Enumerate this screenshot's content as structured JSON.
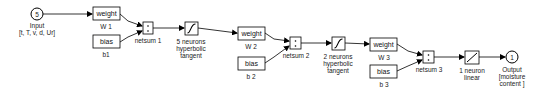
{
  "diagram": {
    "type": "neural-network-simulink",
    "input": {
      "symbol": "5",
      "label": "Input",
      "sublabel": "[t, T, v, d, Ur]"
    },
    "layers": [
      {
        "weight": {
          "box": "weight",
          "label": "W 1"
        },
        "bias": {
          "box": "bias",
          "label": "b1"
        },
        "netsum": {
          "label": "netsum 1"
        },
        "transfer": {
          "line1": "5 neurons",
          "line2": "hyperbolic",
          "line3": "tangent",
          "icon": "tansig-icon"
        }
      },
      {
        "weight": {
          "box": "weight",
          "label": "W 2"
        },
        "bias": {
          "box": "bias",
          "label": "b 2"
        },
        "netsum": {
          "label": "netsum 2"
        },
        "transfer": {
          "line1": "2 neurons",
          "line2": "hyperbolic",
          "line3": "tangent",
          "icon": "tansig-icon"
        }
      },
      {
        "weight": {
          "box": "weight",
          "label": "W 3"
        },
        "bias": {
          "box": "bias",
          "label": "b 3"
        },
        "netsum": {
          "label": "netsum 3"
        },
        "transfer": {
          "line1": "1 neuron",
          "line2": "linear",
          "icon": "purelin-icon"
        }
      }
    ],
    "output": {
      "symbol": "1",
      "label": "Output",
      "sublabel1": "[moisture",
      "sublabel2": "content ]"
    }
  }
}
